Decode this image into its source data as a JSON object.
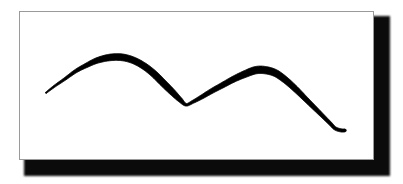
{
  "figure": {
    "alt_title": "Hand-drawn bimodal curve",
    "frame": {
      "background_color": "#ffffff",
      "border_color": "#9a9a9a",
      "shadow_color": "#0b0b0b"
    },
    "page_background_color": "#ffffff"
  },
  "chart_data": {
    "type": "line",
    "title": "",
    "subtitle": "",
    "xlabel": "",
    "ylabel": "",
    "grid": false,
    "legend": null,
    "axes_visible": false,
    "tick_labels_x": [],
    "tick_labels_y": [],
    "style": {
      "stroke_color": "#000000",
      "stroke_style": "hand-drawn variable-width brush",
      "min_stroke_width": 1.2,
      "max_stroke_width": 7.5,
      "smoothing": "cardinal-spline"
    },
    "xlim": [
      0,
      403
    ],
    "ylim": [
      184,
      0
    ],
    "series": [
      {
        "name": "curve",
        "points": [
          {
            "x": 45,
            "y": 93,
            "w": 1.3
          },
          {
            "x": 54,
            "y": 86,
            "w": 2.0
          },
          {
            "x": 64,
            "y": 79,
            "w": 2.6
          },
          {
            "x": 75,
            "y": 71,
            "w": 3.4
          },
          {
            "x": 86,
            "y": 65,
            "w": 4.4
          },
          {
            "x": 97,
            "y": 60,
            "w": 5.6
          },
          {
            "x": 110,
            "y": 57,
            "w": 6.6
          },
          {
            "x": 122,
            "y": 57,
            "w": 6.8
          },
          {
            "x": 133,
            "y": 60,
            "w": 6.6
          },
          {
            "x": 144,
            "y": 66,
            "w": 6.6
          },
          {
            "x": 154,
            "y": 74,
            "w": 6.8
          },
          {
            "x": 163,
            "y": 83,
            "w": 6.8
          },
          {
            "x": 172,
            "y": 92,
            "w": 6.2
          },
          {
            "x": 180,
            "y": 100,
            "w": 4.6
          },
          {
            "x": 186,
            "y": 105,
            "w": 2.6
          },
          {
            "x": 193,
            "y": 102,
            "w": 3.0
          },
          {
            "x": 202,
            "y": 97,
            "w": 4.0
          },
          {
            "x": 212,
            "y": 91,
            "w": 4.8
          },
          {
            "x": 223,
            "y": 85,
            "w": 5.4
          },
          {
            "x": 234,
            "y": 79,
            "w": 6.0
          },
          {
            "x": 245,
            "y": 74,
            "w": 6.8
          },
          {
            "x": 256,
            "y": 70,
            "w": 7.4
          },
          {
            "x": 266,
            "y": 70,
            "w": 7.4
          },
          {
            "x": 276,
            "y": 73,
            "w": 7.0
          },
          {
            "x": 286,
            "y": 80,
            "w": 6.4
          },
          {
            "x": 296,
            "y": 89,
            "w": 5.8
          },
          {
            "x": 306,
            "y": 99,
            "w": 5.0
          },
          {
            "x": 315,
            "y": 108,
            "w": 4.4
          },
          {
            "x": 324,
            "y": 117,
            "w": 3.8
          },
          {
            "x": 331,
            "y": 124,
            "w": 3.4
          },
          {
            "x": 336,
            "y": 129,
            "w": 3.2
          },
          {
            "x": 342,
            "y": 131,
            "w": 3.2
          },
          {
            "x": 346,
            "y": 131,
            "w": 3.0
          }
        ],
        "peaks": [
          {
            "label": "first-peak",
            "x": 116,
            "y": 57
          },
          {
            "label": "second-peak",
            "x": 262,
            "y": 69
          }
        ],
        "troughs": [
          {
            "label": "valley",
            "x": 186,
            "y": 105
          }
        ],
        "endpoints": {
          "start": {
            "x": 45,
            "y": 93
          },
          "end": {
            "x": 346,
            "y": 131
          }
        }
      }
    ]
  }
}
